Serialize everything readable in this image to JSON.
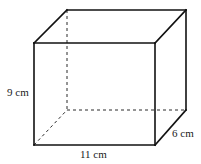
{
  "figure": {
    "name": "cuboid-diagram",
    "shape": "rectangular-prism",
    "stroke_color": "#1a1a1a",
    "background_color": "#ffffff",
    "labels": {
      "height": "9 cm",
      "width": "11 cm",
      "depth": "6 cm"
    },
    "dimensions": {
      "height_value": 9,
      "width_value": 11,
      "depth_value": 6,
      "unit": "cm"
    },
    "vertices": {
      "front_top_left": [
        34,
        43
      ],
      "front_top_right": [
        155,
        43
      ],
      "front_bottom_right": [
        155,
        145
      ],
      "front_bottom_left": [
        34,
        145
      ],
      "back_top_left": [
        67,
        10
      ],
      "back_top_right": [
        186,
        10
      ],
      "back_bottom_right": [
        186,
        110
      ],
      "back_bottom_left": [
        67,
        110
      ]
    },
    "edges": {
      "solid": [
        "front-top",
        "front-right",
        "front-bottom",
        "front-left",
        "back-top",
        "back-right",
        "top-left-connector",
        "top-right-connector",
        "bottom-right-connector"
      ],
      "hidden_dashed": [
        "back-left-vertical",
        "back-bottom",
        "bottom-left-connector"
      ]
    }
  }
}
